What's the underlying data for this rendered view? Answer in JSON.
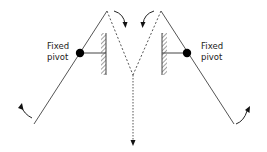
{
  "diagram": {
    "type": "mechanism",
    "labels": {
      "left_pivot_line1": "Fixed",
      "left_pivot_line2": "pivot",
      "right_pivot_line1": "Fixed",
      "right_pivot_line2": "pivot"
    },
    "colors": {
      "line": "#555555",
      "pivot": "#000000",
      "background": "#ffffff"
    }
  }
}
